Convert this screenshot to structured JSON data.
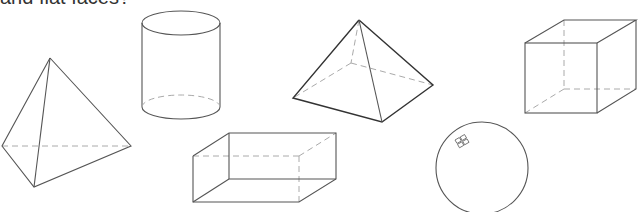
{
  "heading": {
    "text": "and flat faces?"
  },
  "shapes": [
    {
      "name": "triangular pyramid",
      "kind": "tetrahedron"
    },
    {
      "name": "cylinder",
      "kind": "cylinder"
    },
    {
      "name": "square pyramid",
      "kind": "pyramid"
    },
    {
      "name": "cube",
      "kind": "cube"
    },
    {
      "name": "rectangular prism",
      "kind": "cuboid"
    },
    {
      "name": "sphere",
      "kind": "sphere"
    }
  ],
  "colors": {
    "line": "#555555",
    "hidden_line": "#aaaaaa",
    "background": "#ffffff"
  }
}
